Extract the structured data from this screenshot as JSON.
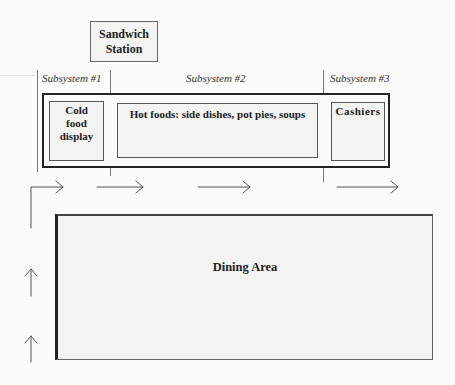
{
  "diagram": {
    "stations": {
      "sandwich": "Sandwich Station",
      "cold_food": "Cold food display",
      "hot_foods": "Hot foods: side dishes, pot pies, soups",
      "cashiers": "Cashiers",
      "dining": "Dining Area"
    },
    "subsystems": [
      {
        "label": "Subsystem #1"
      },
      {
        "label": "Subsystem #2"
      },
      {
        "label": "Subsystem #3"
      }
    ],
    "flow_arrows": [
      {
        "direction": "up",
        "position": "left-lower"
      },
      {
        "direction": "up",
        "position": "left-middle"
      },
      {
        "direction": "right",
        "position": "elbow-to-subsystem-1"
      },
      {
        "direction": "right",
        "position": "subsystem-2-start"
      },
      {
        "direction": "right",
        "position": "subsystem-2-mid"
      },
      {
        "direction": "right",
        "position": "subsystem-3-exit"
      }
    ],
    "colors": {
      "background": "#fbfbfa",
      "box_fill": "#f3f3f2",
      "line": "#555555",
      "heavy_border": "#222222"
    }
  }
}
